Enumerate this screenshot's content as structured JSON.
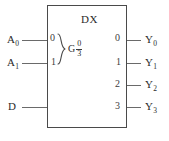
{
  "diagram": {
    "title": "DX",
    "block": {
      "internal_function_label": "G",
      "control_range_numerator": "0",
      "control_range_denominator": "3"
    },
    "inputs": [
      {
        "name": "A0",
        "label": "A",
        "subscript": "0",
        "weight": "0",
        "y": 40
      },
      {
        "name": "A1",
        "label": "A",
        "subscript": "1",
        "weight": "1",
        "y": 63
      },
      {
        "name": "D",
        "label": "D",
        "subscript": "",
        "weight": "",
        "y": 107
      }
    ],
    "outputs": [
      {
        "name": "Y0",
        "index": "0",
        "label": "Y",
        "subscript": "0",
        "y": 40
      },
      {
        "name": "Y1",
        "index": "1",
        "label": "Y",
        "subscript": "1",
        "y": 63
      },
      {
        "name": "Y2",
        "index": "2",
        "label": "Y",
        "subscript": "2",
        "y": 85
      },
      {
        "name": "Y3",
        "index": "3",
        "label": "Y",
        "subscript": "3",
        "y": 107
      }
    ],
    "colors": {
      "background": "#ffffff",
      "outline": "#4a4a4a",
      "wire": "#6a6a6a",
      "text": "#2b2b2b"
    }
  }
}
